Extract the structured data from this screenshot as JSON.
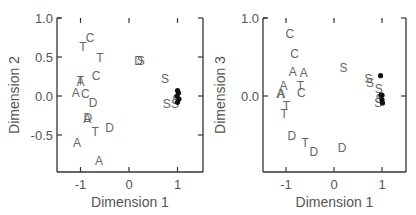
{
  "chart_data": [
    {
      "type": "scatter",
      "title": "",
      "xlabel": "Dimension 1",
      "ylabel": "Dimension 2",
      "xlim": [
        -1.5,
        1.5
      ],
      "ylim": [
        -0.97,
        1.0
      ],
      "xticks": [
        "-1",
        "0",
        "1"
      ],
      "xtick_values": [
        -1,
        0,
        1
      ],
      "yticks": [
        "1.0",
        "0.5",
        "0.0",
        "-0.5"
      ],
      "ytick_values": [
        1.0,
        0.5,
        0.0,
        -0.5
      ],
      "grid": false,
      "legend": null,
      "points": [
        {
          "label": "C",
          "x": -0.8,
          "y": 0.75
        },
        {
          "label": "T",
          "x": -0.95,
          "y": 0.64
        },
        {
          "label": "T",
          "x": -0.6,
          "y": 0.49
        },
        {
          "label": "C",
          "x": -0.68,
          "y": 0.26
        },
        {
          "label": "A",
          "x": -1.0,
          "y": 0.19
        },
        {
          "label": "T",
          "x": -1.0,
          "y": 0.2
        },
        {
          "label": "A",
          "x": -1.1,
          "y": 0.04
        },
        {
          "label": "C",
          "x": -0.9,
          "y": 0.03
        },
        {
          "label": "D",
          "x": -0.74,
          "y": -0.08
        },
        {
          "label": "D",
          "x": -0.85,
          "y": -0.27
        },
        {
          "label": "A",
          "x": -0.86,
          "y": -0.29
        },
        {
          "label": "T",
          "x": -0.7,
          "y": -0.45
        },
        {
          "label": "D",
          "x": -0.4,
          "y": -0.4
        },
        {
          "label": "A",
          "x": -1.07,
          "y": -0.6
        },
        {
          "label": "A",
          "x": -0.62,
          "y": -0.83
        },
        {
          "label": "D",
          "x": 0.2,
          "y": 0.46
        },
        {
          "label": "S",
          "x": 0.24,
          "y": 0.46
        },
        {
          "label": "S",
          "x": 0.74,
          "y": 0.22
        },
        {
          "label": "S",
          "x": 0.78,
          "y": -0.1
        },
        {
          "label": "S",
          "x": 0.95,
          "y": -0.1
        },
        {
          "label": "S",
          "x": 0.97,
          "y": -0.05
        }
      ],
      "filled_points": [
        {
          "x": 1.0,
          "y": 0.07
        },
        {
          "x": 1.02,
          "y": 0.04
        },
        {
          "x": 0.99,
          "y": 0.0
        },
        {
          "x": 1.03,
          "y": -0.04
        },
        {
          "x": 1.0,
          "y": -0.08
        }
      ]
    },
    {
      "type": "scatter",
      "title": "",
      "xlabel": "Dimension 1",
      "ylabel": "Dimension 3",
      "xlim": [
        -1.5,
        1.5
      ],
      "ylim": [
        -0.97,
        1.0
      ],
      "xticks": [
        "-1",
        "0",
        "1"
      ],
      "xtick_values": [
        -1,
        0,
        1
      ],
      "yticks": [
        "1.0",
        "0.0"
      ],
      "ytick_values": [
        1.0,
        0.0
      ],
      "grid": false,
      "legend": null,
      "points": [
        {
          "label": "C",
          "x": -0.92,
          "y": 0.8
        },
        {
          "label": "C",
          "x": -0.82,
          "y": 0.55
        },
        {
          "label": "A",
          "x": -0.86,
          "y": 0.31
        },
        {
          "label": "A",
          "x": -0.63,
          "y": 0.3
        },
        {
          "label": "A",
          "x": -1.05,
          "y": 0.14
        },
        {
          "label": "T",
          "x": -0.7,
          "y": 0.14
        },
        {
          "label": "C",
          "x": -0.68,
          "y": 0.04
        },
        {
          "label": "A",
          "x": -1.12,
          "y": 0.03
        },
        {
          "label": "A",
          "x": -1.1,
          "y": 0.03
        },
        {
          "label": "T",
          "x": -0.99,
          "y": -0.12
        },
        {
          "label": "T",
          "x": -1.04,
          "y": -0.23
        },
        {
          "label": "D",
          "x": -0.88,
          "y": -0.51
        },
        {
          "label": "T",
          "x": -0.6,
          "y": -0.6
        },
        {
          "label": "D",
          "x": -0.42,
          "y": -0.71
        },
        {
          "label": "D",
          "x": 0.17,
          "y": -0.66
        },
        {
          "label": "S",
          "x": 0.2,
          "y": 0.36
        },
        {
          "label": "S",
          "x": 0.72,
          "y": 0.22
        },
        {
          "label": "S",
          "x": 0.75,
          "y": 0.17
        },
        {
          "label": "S",
          "x": 0.93,
          "y": 0.1
        },
        {
          "label": "S",
          "x": 0.92,
          "y": -0.08
        },
        {
          "label": "S",
          "x": 0.95,
          "y": -0.03
        }
      ],
      "filled_points": [
        {
          "x": 0.97,
          "y": 0.26
        },
        {
          "x": 0.98,
          "y": 0.01
        },
        {
          "x": 1.0,
          "y": 0.01
        },
        {
          "x": 1.0,
          "y": -0.05
        },
        {
          "x": 1.01,
          "y": -0.09
        }
      ]
    }
  ]
}
